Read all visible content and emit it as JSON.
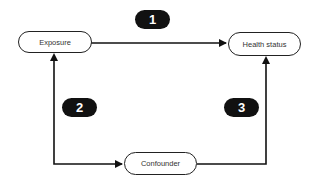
{
  "diagram": {
    "nodes": {
      "exposure": "Exposure",
      "health_status": "Health status",
      "confounder": "Confounder"
    },
    "edges": [
      {
        "id": "1",
        "from": "Exposure",
        "to": "Health status",
        "label": "1"
      },
      {
        "id": "2",
        "from": "Confounder",
        "to": "Exposure",
        "label": "2",
        "bidirectional": true
      },
      {
        "id": "3",
        "from": "Confounder",
        "to": "Health status",
        "label": "3"
      }
    ],
    "badges": [
      "1",
      "2",
      "3"
    ],
    "colors": {
      "line": "#111111",
      "badge_bg": "#111111",
      "badge_text": "#ffffff",
      "node_border": "#222222"
    }
  }
}
